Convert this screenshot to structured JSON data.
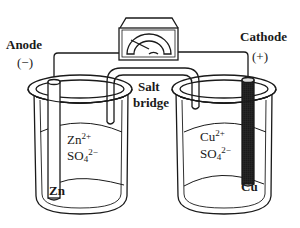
{
  "diagram": {
    "type": "galvanic-cell",
    "anode": {
      "label": "Anode",
      "sign": "(−)",
      "electrode": "Zn"
    },
    "cathode": {
      "label": "Cathode",
      "sign": "(+)",
      "electrode": "Cu"
    },
    "salt_bridge": {
      "line1": "Salt",
      "line2": "bridge"
    },
    "left_solution": {
      "cation_base": "Zn",
      "cation_charge": "2+",
      "anion_base": "SO",
      "anion_sub": "4",
      "anion_charge": "2−"
    },
    "right_solution": {
      "cation_base": "Cu",
      "cation_charge": "2+",
      "anion_base": "SO",
      "anion_sub": "4",
      "anion_charge": "2−"
    },
    "meter": {
      "icon": "voltmeter-icon"
    },
    "colors": {
      "ink": "#1a1a1a",
      "copper_fill": "#9a9a9a",
      "background": "#ffffff"
    }
  }
}
